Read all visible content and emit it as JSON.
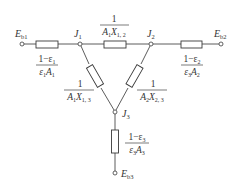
{
  "diagram": {
    "type": "radiation-network",
    "nodes": {
      "eb1": {
        "main": "E",
        "sub": "b1"
      },
      "eb2": {
        "main": "E",
        "sub": "b2"
      },
      "eb3": {
        "main": "E",
        "sub": "b3"
      },
      "j1": {
        "main": "J",
        "sub": "1"
      },
      "j2": {
        "main": "J",
        "sub": "2"
      },
      "j3": {
        "main": "J",
        "sub": "3"
      }
    },
    "resistances": {
      "surface1": {
        "num": "1−ε",
        "num_sub": "1",
        "den_a": "ε",
        "den_a_sub": "1",
        "den_b": "A",
        "den_b_sub": "1"
      },
      "surface2": {
        "num": "1−ε",
        "num_sub": "2",
        "den_a": "ε",
        "den_a_sub": "3",
        "den_b": "A",
        "den_b_sub": "2"
      },
      "surface3": {
        "num": "1−ε",
        "num_sub": "3",
        "den_a": "ε",
        "den_a_sub": "3",
        "den_b": "A",
        "den_b_sub": "3"
      },
      "space12": {
        "num": "1",
        "den_a": "A",
        "den_a_sub": "1",
        "den_b": "X",
        "den_b_sub": "1, 2"
      },
      "space13": {
        "num": "1",
        "den_a": "A",
        "den_a_sub": "1",
        "den_b": "X",
        "den_b_sub": "1, 3"
      },
      "space23": {
        "num": "1",
        "den_a": "A",
        "den_a_sub": "2",
        "den_b": "X",
        "den_b_sub": "2, 3"
      }
    }
  }
}
